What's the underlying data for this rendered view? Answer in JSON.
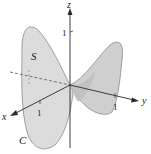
{
  "diagram": {
    "type": "3d-surface-saddle",
    "axes": {
      "x": {
        "label": "x",
        "tick": "1"
      },
      "y": {
        "label": "y",
        "tick": "1"
      },
      "z": {
        "label": "z",
        "tick": "1"
      }
    },
    "surface_label": "S",
    "boundary_curve_label": "C",
    "colors": {
      "surface_fill": "#d4d4d4",
      "surface_edge": "#8a8a8a",
      "axis": "#2a2a2a",
      "background": "#ffffff"
    }
  }
}
